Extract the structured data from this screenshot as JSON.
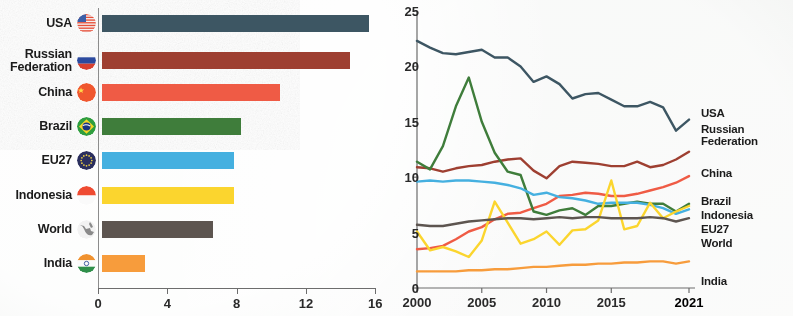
{
  "chart_data": [
    {
      "type": "bar",
      "title": "",
      "orientation": "horizontal",
      "xlabel": "",
      "ylabel": "",
      "xlim": [
        0,
        16
      ],
      "xticks": [
        0,
        4,
        8,
        12,
        16
      ],
      "grid": false,
      "categories": [
        "USA",
        "Russian Federation",
        "China",
        "Brazil",
        "EU27",
        "Indonesia",
        "World",
        "India"
      ],
      "values": [
        15.4,
        14.3,
        10.3,
        8.0,
        7.6,
        7.6,
        6.4,
        2.5
      ],
      "colors": [
        "#3d5663",
        "#9e3f31",
        "#ef5b45",
        "#3f7d3b",
        "#45b0e0",
        "#fbd52e",
        "#5d5550",
        "#f79c3c"
      ],
      "flags": [
        "flag-usa",
        "flag-russia",
        "flag-china",
        "flag-brazil",
        "flag-eu27",
        "flag-indonesia",
        "flag-world",
        "flag-india"
      ]
    },
    {
      "type": "line",
      "title": "",
      "xlabel": "",
      "ylabel": "",
      "xlim": [
        2000,
        2021
      ],
      "ylim": [
        0,
        25
      ],
      "yticks": [
        0,
        5,
        10,
        15,
        20,
        25
      ],
      "xticks": [
        2000,
        2005,
        2010,
        2015,
        2021
      ],
      "grid": false,
      "legend_position": "right",
      "x": [
        2000,
        2001,
        2002,
        2003,
        2004,
        2005,
        2006,
        2007,
        2008,
        2009,
        2010,
        2011,
        2012,
        2013,
        2014,
        2015,
        2016,
        2017,
        2018,
        2019,
        2020,
        2021
      ],
      "series": [
        {
          "name": "USA",
          "color": "#3d5663",
          "values": [
            22.3,
            21.7,
            21.2,
            21.1,
            21.3,
            21.5,
            20.8,
            20.8,
            20.0,
            18.6,
            19.1,
            18.4,
            17.1,
            17.5,
            17.6,
            17.0,
            16.4,
            16.4,
            16.8,
            16.3,
            14.2,
            15.2
          ]
        },
        {
          "name": "Russian Federation",
          "color": "#9e3f31",
          "values": [
            10.9,
            10.8,
            10.5,
            10.8,
            11.0,
            11.1,
            11.4,
            11.6,
            11.7,
            10.6,
            9.9,
            11.0,
            11.4,
            11.3,
            11.2,
            11.0,
            11.0,
            11.4,
            10.9,
            11.1,
            11.6,
            12.3,
            13.1,
            12.1,
            14.2
          ]
        },
        {
          "name": "China",
          "color": "#ef5b45",
          "values": [
            3.5,
            3.6,
            3.8,
            4.4,
            5.1,
            5.5,
            6.2,
            6.7,
            6.8,
            7.2,
            7.6,
            8.3,
            8.4,
            8.6,
            8.5,
            8.3,
            8.3,
            8.5,
            8.8,
            9.1,
            9.5,
            10.1
          ]
        },
        {
          "name": "Brazil",
          "color": "#3f7d3b",
          "values": [
            11.4,
            10.7,
            12.8,
            16.4,
            19.0,
            15.0,
            12.2,
            10.5,
            10.2,
            6.9,
            6.6,
            7.0,
            7.2,
            6.6,
            7.4,
            7.4,
            7.6,
            7.8,
            7.6,
            7.6,
            6.9,
            7.6
          ]
        },
        {
          "name": "EU27",
          "color": "#45b0e0",
          "values": [
            9.6,
            9.7,
            9.6,
            9.7,
            9.7,
            9.6,
            9.5,
            9.3,
            9.0,
            8.4,
            8.6,
            8.2,
            8.1,
            7.9,
            7.6,
            7.7,
            7.7,
            7.7,
            7.5,
            7.2,
            6.7,
            7.1
          ]
        },
        {
          "name": "Indonesia",
          "color": "#fbd52e",
          "values": [
            5.1,
            3.4,
            3.7,
            3.3,
            2.8,
            4.3,
            7.8,
            5.9,
            4.0,
            4.4,
            5.1,
            3.9,
            5.2,
            5.3,
            6.1,
            9.7,
            5.3,
            5.6,
            7.7,
            6.3,
            6.9,
            7.4
          ]
        },
        {
          "name": "World",
          "color": "#5d5550",
          "values": [
            5.7,
            5.6,
            5.6,
            5.8,
            6.0,
            6.1,
            6.2,
            6.3,
            6.3,
            6.2,
            6.3,
            6.4,
            6.3,
            6.4,
            6.4,
            6.3,
            6.3,
            6.3,
            6.4,
            6.3,
            6.0,
            6.3
          ]
        },
        {
          "name": "India",
          "color": "#f79c3c",
          "values": [
            1.5,
            1.5,
            1.5,
            1.5,
            1.6,
            1.6,
            1.7,
            1.7,
            1.8,
            1.9,
            1.9,
            2.0,
            2.1,
            2.1,
            2.2,
            2.2,
            2.3,
            2.3,
            2.4,
            2.4,
            2.2,
            2.4
          ]
        }
      ]
    }
  ],
  "bar_chart": {
    "rows": [
      {
        "label_line1": "USA",
        "label_line2": "",
        "value": 15.4,
        "color": "#3d5663",
        "flag": "flag-usa"
      },
      {
        "label_line1": "Russian",
        "label_line2": "Federation",
        "value": 14.3,
        "color": "#9e3f31",
        "flag": "flag-russia"
      },
      {
        "label_line1": "China",
        "label_line2": "",
        "value": 10.3,
        "color": "#ef5b45",
        "flag": "flag-china"
      },
      {
        "label_line1": "Brazil",
        "label_line2": "",
        "value": 8.0,
        "color": "#3f7d3b",
        "flag": "flag-brazil"
      },
      {
        "label_line1": "EU27",
        "label_line2": "",
        "value": 7.6,
        "color": "#45b0e0",
        "flag": "flag-eu27"
      },
      {
        "label_line1": "Indonesia",
        "label_line2": "",
        "value": 7.6,
        "color": "#fbd52e",
        "flag": "flag-indonesia"
      },
      {
        "label_line1": "World",
        "label_line2": "",
        "value": 6.4,
        "color": "#5d5550",
        "flag": "flag-world"
      },
      {
        "label_line1": "India",
        "label_line2": "",
        "value": 2.5,
        "color": "#f79c3c",
        "flag": "flag-india"
      }
    ],
    "xticks": [
      "0",
      "4",
      "8",
      "12",
      "16"
    ]
  },
  "line_chart": {
    "yticks": [
      "25",
      "20",
      "15",
      "10",
      "5",
      "0"
    ],
    "xticks": [
      "2000",
      "2005",
      "2010",
      "2015",
      "2021"
    ],
    "legend": [
      {
        "line1": "USA",
        "line2": ""
      },
      {
        "line1": "Russian",
        "line2": "Federation"
      },
      {
        "line1": "China",
        "line2": ""
      },
      {
        "line1": "Brazil",
        "line2": ""
      },
      {
        "line1": "Indonesia",
        "line2": ""
      },
      {
        "line1": "EU27",
        "line2": ""
      },
      {
        "line1": "World",
        "line2": ""
      },
      {
        "line1": "India",
        "line2": ""
      }
    ]
  }
}
